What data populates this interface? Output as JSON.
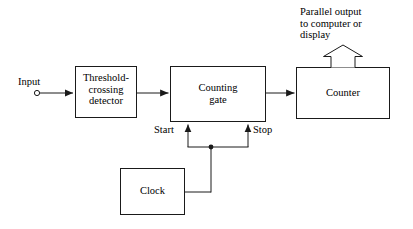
{
  "diagram": {
    "stroke_color": "#1a1a1a",
    "background_color": "#ffffff",
    "blocks": [
      {
        "name": "threshold-detector",
        "label": "Threshold-\ncrossing\ndetector"
      },
      {
        "name": "counting-gate",
        "label": "Counting\ngate"
      },
      {
        "name": "counter",
        "label": "Counter"
      },
      {
        "name": "clock",
        "label": "Clock"
      }
    ],
    "labels": {
      "input": "Input",
      "start": "Start",
      "stop": "Stop",
      "parallel_output": "Parallel output\nto computer or\ndisplay"
    },
    "connections": [
      {
        "name": "input-to-detector",
        "from": "input-terminal",
        "to": "threshold-detector"
      },
      {
        "name": "detector-to-gate",
        "from": "threshold-detector",
        "to": "counting-gate"
      },
      {
        "name": "gate-to-counter",
        "from": "counting-gate",
        "to": "counter"
      },
      {
        "name": "clock-to-start",
        "from": "clock",
        "to": "counting-gate",
        "signal": "Start"
      },
      {
        "name": "clock-to-stop",
        "from": "clock",
        "to": "counting-gate",
        "signal": "Stop"
      },
      {
        "name": "counter-parallel-output",
        "from": "counter",
        "to": "parallel-output"
      }
    ]
  }
}
